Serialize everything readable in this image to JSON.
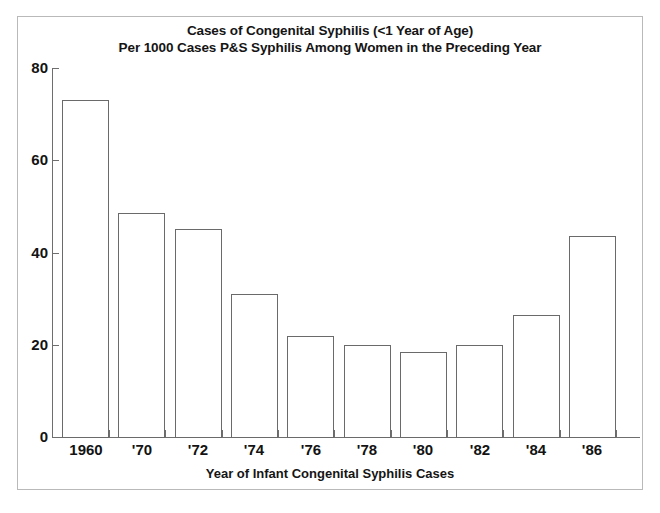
{
  "figure": {
    "title_lines": [
      "Cases of Congenital Syphilis (<1 Year of Age)",
      "Per 1000 Cases P&S Syphilis Among Women in the Preceding Year"
    ],
    "frame_color": "#b9b9b9",
    "axis_color": "#6e6e6e",
    "bar_edge_color": "#6a6a6a",
    "bar_fill_color": "#ffffff",
    "background_color": "#ffffff",
    "text_color": "#131313"
  },
  "chart_data": {
    "type": "bar",
    "title": "Cases of Congenital Syphilis (<1 Year of Age) Per 1000 Cases P&S Syphilis Among Women in the Preceding Year",
    "xlabel": "Year of Infant Congenital Syphilis Cases",
    "ylabel": "",
    "categories": [
      "1960",
      "'70",
      "'72",
      "'74",
      "'76",
      "'78",
      "'80",
      "'82",
      "'84",
      "'86"
    ],
    "values": [
      73,
      48.5,
      45,
      31,
      22,
      20,
      18.5,
      20,
      26.5,
      43.5
    ],
    "ylim": [
      0,
      80
    ],
    "yticks": [
      0,
      20,
      40,
      60,
      80
    ],
    "ytick_labels": [
      "0",
      "20",
      "40",
      "60",
      "80"
    ],
    "xtick_labels": [
      "1960",
      "'70",
      "'72",
      "'74",
      "'76",
      "'78",
      "'80",
      "'82",
      "'84",
      "'86"
    ],
    "grid": false,
    "legend": null,
    "series": [
      {
        "name": "Cases per 1000",
        "values": [
          73,
          48.5,
          45,
          31,
          22,
          20,
          18.5,
          20,
          26.5,
          43.5
        ]
      }
    ]
  }
}
